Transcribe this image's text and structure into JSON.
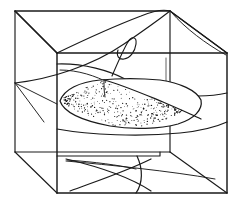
{
  "figure": {
    "title": "Delta wing in wireframe test-section box",
    "ink_color": "#1a1a1a",
    "background_color": "#ffffff",
    "stipple_color": "#111111",
    "parts": {
      "box": "wireframe-box",
      "wing": "delta-wing-body",
      "vortex": "vortex-flow-curves",
      "curl": "vortex-curl-hook",
      "shadow": "floor-projection-lines"
    },
    "labels": [],
    "annotations": [],
    "caption": ""
  },
  "geometry": {
    "box": {
      "front_face": "57,53 227,53 227,193 57,193",
      "back_face": "15,11 170,11 170,152 15,152",
      "connectors": [
        "15,11 57,53",
        "170,11 227,53",
        "15,152 57,193",
        "170,152 227,193"
      ],
      "inner_verticals": [
        "57,53 57,193",
        "170,11 170,152"
      ]
    },
    "wing_outline": "60,101 C 64,89 80,82 100,80 C 120,78 140,78 160,80 C 180,83 196,90 201,100 C 203,110 194,119 178,124 C 160,129 132,130 110,126 C 84,121 64,113 60,101 Z",
    "wing_ridge": "105,80 C 120,84 140,92 162,101 C 178,108 192,114 201,118",
    "vortex_curves": [
      "57,63 C 84,62 110,70 124,78 C 136,85 150,90 170,93 C 192,96 214,96 227,93",
      "60,70 C 78,70 96,76 108,82",
      "57,128 C 90,134 140,136 180,132 C 200,130 216,126 227,121",
      "15,83 C 50,79 92,66 124,44 C 146,29 160,18 170,11",
      "15,11 C 34,30 50,44 57,53",
      "57,53 C 80,42 110,28 140,16 C 152,11 162,9 170,11",
      "170,11 C 186,25 208,42 227,53",
      "170,11 C 180,28 200,44 227,53"
    ],
    "curl_hook": "112,75 C 118,62 124,48 128,42 C 131,37 136,37 136,44 C 136,51 130,57 124,58 C 119,59 116,56 118,50",
    "left_face_lines": [
      "15,83 57,53",
      "15,83 44,120",
      "15,83 57,100"
    ],
    "floor_projection": [
      "66,158 C 100,166 130,176 150,190",
      "150,158 C 126,170 96,180 70,190",
      "137,155 C 142,168 142,182 136,192",
      "66,160 C 110,164 170,170 214,178"
    ],
    "faint_vertical": "166,58 166,88",
    "floor_front_step": "57,160 160,160 160,152"
  },
  "stipple": {
    "dot_count": 470,
    "dot_radius": 0.52,
    "region": "wing upper surface"
  }
}
